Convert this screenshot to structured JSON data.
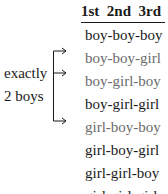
{
  "table": {
    "header": "1st  2nd  3rd",
    "columns": [
      "1st",
      "2nd",
      "3rd"
    ],
    "rows": [
      {
        "label": "boy-boy-boy",
        "highlighted": false
      },
      {
        "label": "boy-boy-girl",
        "highlighted": true
      },
      {
        "label": "boy-girl-boy",
        "highlighted": true
      },
      {
        "label": "boy-girl-girl",
        "highlighted": false
      },
      {
        "label": "girl-boy-boy",
        "highlighted": true
      },
      {
        "label": "girl-boy-girl",
        "highlighted": false
      },
      {
        "label": "girl-girl-boy",
        "highlighted": false
      },
      {
        "label": "girl-girl-girl",
        "highlighted": false
      }
    ]
  },
  "annotation": {
    "line1": "exactly",
    "line2": "2 boys"
  },
  "colors": {
    "text": "#1a1a1a",
    "highlighted_text": "#6b6b6b"
  }
}
